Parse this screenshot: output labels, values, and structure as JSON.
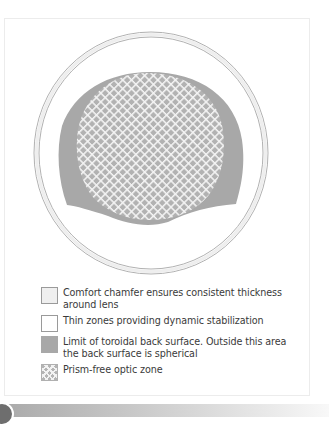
{
  "diagram": {
    "zones": [
      {
        "id": "comfort-chamfer",
        "fill": "#efefef",
        "stroke": "#a0a0a0"
      },
      {
        "id": "thin-zones",
        "fill": "#ffffff"
      },
      {
        "id": "toroidal-limit",
        "fill": "#a8a8a8"
      },
      {
        "id": "prism-free-optic-zone",
        "fill": "#b2b2b2",
        "hatch": "#f4f4f4"
      }
    ]
  },
  "legend": {
    "items": [
      {
        "key": "chamfer",
        "label": "Comfort chamfer ensures consistent thickness around lens"
      },
      {
        "key": "thin",
        "label": "Thin zones providing dynamic stabilization"
      },
      {
        "key": "toroidal",
        "label": "Limit of toroidal back surface. Outside this area the back surface is spherical"
      },
      {
        "key": "optic",
        "label": "Prism-free optic zone"
      }
    ]
  },
  "colors": {
    "outline": "#a0a0a0",
    "toroidal": "#a8a8a8",
    "optic_bg": "#b2b2b2",
    "hatch": "#f4f4f4",
    "bar_start": "#a9a9a9",
    "bar_end": "#f8f8f8",
    "tab": "#6e6e6e"
  }
}
